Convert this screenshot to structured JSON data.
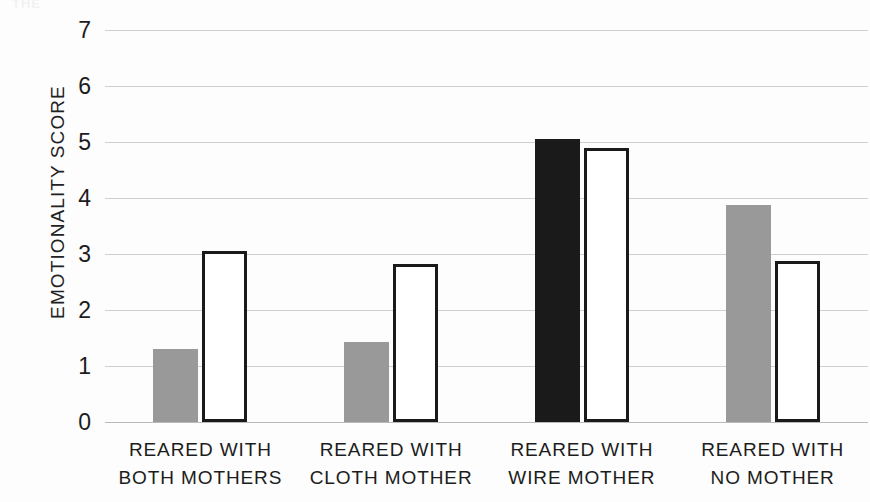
{
  "figure": {
    "caption_remnant": "THE",
    "background_color": "#fdfdfd"
  },
  "colors": {
    "gray_bar": "#999999",
    "black_bar": "#1a1a1a",
    "white_bar_fill": "#ffffff",
    "white_bar_border": "#1a1a1a",
    "gridline": "#cfcfcf",
    "text": "#1c1c1c"
  },
  "chart_data": {
    "type": "bar",
    "title": "",
    "xlabel": "",
    "ylabel": "EMOTIONALITY SCORE",
    "ylim": [
      0,
      7
    ],
    "yticks": [
      0,
      1,
      2,
      3,
      4,
      5,
      6,
      7
    ],
    "ytick_labels": [
      "0",
      "1",
      "2",
      "3",
      "4",
      "5",
      "6",
      "7"
    ],
    "grid": true,
    "legend": false,
    "legend_position": "none",
    "categories": [
      "REARED WITH BOTH MOTHERS",
      "REARED WITH CLOTH MOTHER",
      "REARED WITH WIRE MOTHER",
      "REARED WITH NO MOTHER"
    ],
    "category_lines": [
      [
        "REARED WITH",
        "BOTH MOTHERS"
      ],
      [
        "REARED WITH",
        "CLOTH MOTHER"
      ],
      [
        "REARED WITH",
        "WIRE MOTHER"
      ],
      [
        "REARED WITH",
        "NO MOTHER"
      ]
    ],
    "series": [
      {
        "name": "filled-bar",
        "values": [
          1.3,
          1.42,
          5.05,
          3.87
        ],
        "styles": [
          "gray",
          "gray",
          "black",
          "gray"
        ]
      },
      {
        "name": "outline-bar",
        "values": [
          3.05,
          2.83,
          4.9,
          2.88
        ],
        "styles": [
          "white",
          "white",
          "white",
          "white"
        ]
      }
    ]
  }
}
